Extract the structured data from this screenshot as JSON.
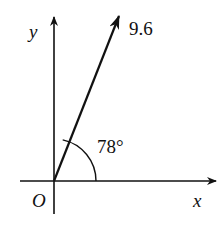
{
  "diagram": {
    "type": "vector-angle",
    "axes": {
      "x_label": "x",
      "y_label": "y",
      "origin_label": "O"
    },
    "vector": {
      "magnitude_label": "9.6",
      "angle_label": "78°",
      "angle_degrees": 78
    },
    "colors": {
      "stroke": "#111111",
      "background": "#ffffff"
    }
  }
}
